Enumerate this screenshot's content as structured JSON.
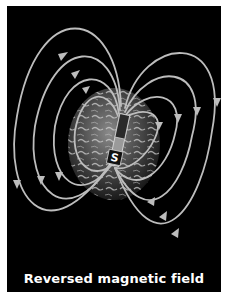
{
  "figure": {
    "caption": "Reversed magnetic field",
    "pole_label": "S",
    "colors": {
      "background": "#000000",
      "field_lines": "#bdbdbd",
      "caption_text": "#ffffff",
      "page": "#ffffff"
    },
    "elements": {
      "earth": "globe-image",
      "magnet": "bar-magnet",
      "field_lines": "magnetic-field-lines-with-arrows"
    }
  }
}
